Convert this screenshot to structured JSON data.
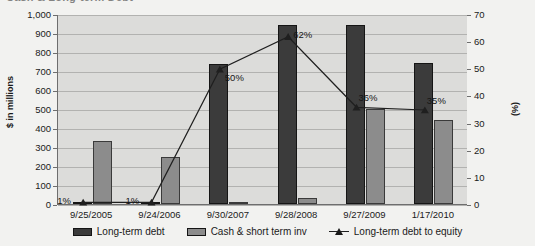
{
  "chart_data": {
    "type": "bar",
    "title": "Cash & Long-term Debt",
    "xlabel": "",
    "ylabel": "$ in millions",
    "y2label": "(%)",
    "ylim": [
      0,
      1000
    ],
    "y2lim": [
      0,
      70
    ],
    "ytick_step": 100,
    "y2tick_step": 10,
    "grid": true,
    "legend_position": "bottom",
    "categories": [
      "9/25/2005",
      "9/24/2006",
      "9/30/2007",
      "9/28/2008",
      "9/27/2009",
      "1/17/2010"
    ],
    "yticks": [
      "0",
      "100",
      "200",
      "300",
      "400",
      "500",
      "600",
      "700",
      "800",
      "900",
      "1,000"
    ],
    "y2ticks": [
      "0",
      "10",
      "20",
      "30",
      "40",
      "50",
      "60",
      "70"
    ],
    "series": [
      {
        "name": "Long-term debt",
        "type": "bar",
        "axis": "left",
        "color": "#3b3b3b",
        "values": [
          5,
          5,
          735,
          940,
          940,
          740
        ]
      },
      {
        "name": "Cash & short term inv",
        "type": "bar",
        "axis": "left",
        "color": "#8c8c8c",
        "values": [
          330,
          250,
          10,
          30,
          500,
          440
        ]
      },
      {
        "name": "Long-term debt to equity",
        "type": "line",
        "axis": "right",
        "color": "#1f1f1f",
        "marker": "triangle",
        "values": [
          1,
          1,
          50,
          62,
          36,
          35
        ],
        "labels": [
          "1%",
          "1%",
          "50%",
          "62%",
          "36%",
          "35%"
        ]
      }
    ]
  }
}
